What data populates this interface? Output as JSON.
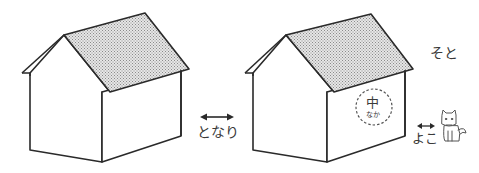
{
  "figure": {
    "houses": [
      {
        "id": "left-house",
        "roof_pattern": "crosshatch"
      },
      {
        "id": "right-house",
        "roof_pattern": "crosshatch",
        "inside_marker": {
          "kanji": "中",
          "reading": "なか"
        }
      }
    ],
    "labels": {
      "tonari": "となり",
      "yoko": "よこ",
      "soto": "そと",
      "naka_kanji": "中",
      "naka_reading": "なか"
    },
    "icons": {
      "tonari_arrow": "double-arrow-icon",
      "yoko_arrow": "double-arrow-icon",
      "dog": "dog-icon"
    },
    "colors": {
      "line": "#2a2a2a",
      "roof_fill": "#c8c8c8",
      "background": "#ffffff"
    }
  }
}
